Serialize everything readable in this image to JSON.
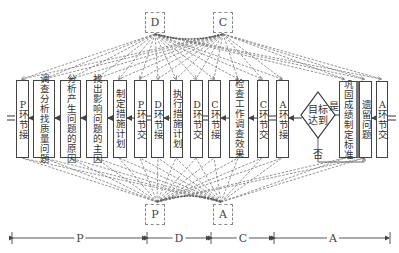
{
  "diagram": {
    "type": "PDCA process flow",
    "top_connectors": [
      {
        "id": "D",
        "label": "D"
      },
      {
        "id": "C",
        "label": "C"
      }
    ],
    "bottom_connectors": [
      {
        "id": "P",
        "label": "P"
      },
      {
        "id": "A",
        "label": "A"
      }
    ],
    "steps": [
      {
        "id": "p-handover-in",
        "label": "P环节接",
        "lines": [
          "P",
          "环",
          "节",
          "接"
        ]
      },
      {
        "id": "investigate",
        "label": "调查分析找质量问题",
        "lines": [
          "调查分析找质量问题"
        ]
      },
      {
        "id": "analyze-causes",
        "label": "分析产生问题的原因",
        "lines": [
          "分析产生问题的原因"
        ]
      },
      {
        "id": "find-main-cause",
        "label": "找出影响问题的主因",
        "lines": [
          "找出影响问题的主因"
        ]
      },
      {
        "id": "make-plan",
        "label": "制定措施计划",
        "lines": [
          "制定措施计划"
        ]
      },
      {
        "id": "p-handover-out",
        "label": "P环节交",
        "lines": [
          "P",
          "环",
          "节",
          "交"
        ]
      },
      {
        "id": "d-handover-in",
        "label": "D环节接",
        "lines": [
          "D",
          "环",
          "节",
          "接"
        ]
      },
      {
        "id": "execute-plan",
        "label": "执行措施计划",
        "lines": [
          "执行措施计划"
        ]
      },
      {
        "id": "d-handover-out",
        "label": "D环节交",
        "lines": [
          "D",
          "环",
          "节",
          "交"
        ]
      },
      {
        "id": "c-handover-in",
        "label": "C环节接",
        "lines": [
          "C",
          "环",
          "节",
          "接"
        ]
      },
      {
        "id": "check-results",
        "label": "检查工作调查效果",
        "lines": [
          "检查工作调查效果"
        ]
      },
      {
        "id": "c-handover-out",
        "label": "C环节交",
        "lines": [
          "C",
          "环",
          "节",
          "交"
        ]
      },
      {
        "id": "a-handover-in",
        "label": "A环节接",
        "lines": [
          "A",
          "环",
          "节",
          "接"
        ]
      },
      {
        "id": "goal-reached",
        "label": "目标达到",
        "shape": "diamond"
      },
      {
        "id": "consolidate",
        "label": "巩固成绩制定标准",
        "lines": [
          "巩固成绩制定标准"
        ]
      },
      {
        "id": "remaining-issues",
        "label": "遗留问题",
        "lines": [
          "遗留问题"
        ]
      },
      {
        "id": "a-handover-out",
        "label": "A环节交",
        "lines": [
          "A",
          "环",
          "节",
          "交"
        ]
      }
    ],
    "decision": {
      "yes_label": "是",
      "no_label": "否"
    },
    "phase_axis": [
      {
        "label": "P"
      },
      {
        "label": "D"
      },
      {
        "label": "C"
      },
      {
        "label": "A"
      }
    ]
  },
  "text": {
    "s0": "P环节接",
    "s1a": "调查分析",
    "s1b": "找质量问题",
    "s2a": "分析产生",
    "s2b": "问题的原因",
    "s3a": "找出影响",
    "s3b": "问题的主因",
    "s4": "制定措施计划",
    "s5": "P环节交",
    "s6": "D环节接",
    "s7": "执行措施计划",
    "s8": "D环节交",
    "s9": "C环节接",
    "s10a": "检查工作",
    "s10b": "调查效果",
    "s11": "C环节交",
    "s12": "A环节接",
    "diamond_a": "目标",
    "diamond_b": "达到",
    "s14a": "巩固成绩",
    "s14b": "制定标准",
    "s15": "遗留问题",
    "s16": "A环节交",
    "yes": "是",
    "no": "否",
    "top_D": "D",
    "top_C": "C",
    "bot_P": "P",
    "bot_A": "A",
    "axis_P": "P",
    "axis_D": "D",
    "axis_C": "C",
    "axis_A": "A"
  }
}
